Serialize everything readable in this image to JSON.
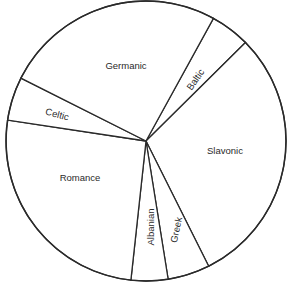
{
  "chart_data": {
    "type": "pie",
    "title": "",
    "start_angle_deg": 28.8,
    "direction": "clockwise",
    "categories": [
      "Baltic",
      "Slavonic",
      "Greek",
      "Albanian",
      "Romance",
      "Celtic",
      "Germanic"
    ],
    "values": [
      16.5,
      108.1,
      17.5,
      15.3,
      92.4,
      18.1,
      92.1
    ],
    "units": "degrees (approximate share of circle)",
    "percentages": [
      4.6,
      30.0,
      4.9,
      4.3,
      25.7,
      5.0,
      25.6
    ],
    "legend": "none (labels inside slices)",
    "labels": [
      {
        "text": "Baltic",
        "x": 196,
        "y": 80,
        "rotate": -55
      },
      {
        "text": "Slavonic",
        "x": 225,
        "y": 151,
        "rotate": 0
      },
      {
        "text": "Greek",
        "x": 177,
        "y": 230,
        "rotate": -78
      },
      {
        "text": "Albanian",
        "x": 151,
        "y": 227,
        "rotate": -90
      },
      {
        "text": "Romance",
        "x": 80,
        "y": 178,
        "rotate": 0
      },
      {
        "text": "Celtic",
        "x": 57,
        "y": 115,
        "rotate": 15
      },
      {
        "text": "Germanic",
        "x": 126,
        "y": 66,
        "rotate": 0
      }
    ]
  },
  "geometry": {
    "cx": 146,
    "cy": 141,
    "r": 140
  },
  "colors": {
    "fill": "#ffffff",
    "stroke": "#2a2a2a",
    "text": "#2a2a2a"
  }
}
